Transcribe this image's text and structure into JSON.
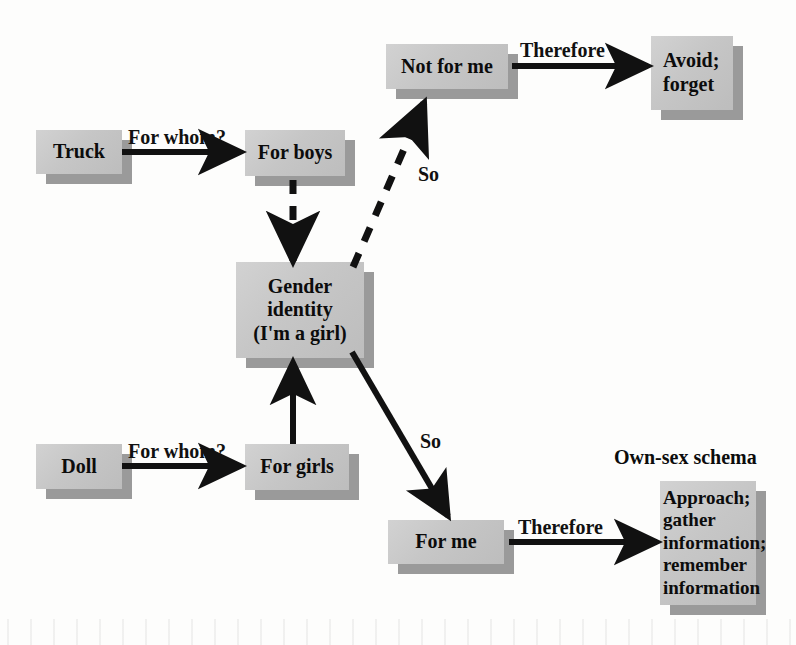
{
  "diagram": {
    "type": "flowchart",
    "colors": {
      "box_fill": "#c6c6c6",
      "box_shadow": "#9a9a9a",
      "text": "#0c0c0c",
      "arrow": "#111111",
      "background": "#fdfdfc"
    },
    "nodes": [
      {
        "id": "truck",
        "label": "Truck"
      },
      {
        "id": "for_boys",
        "label": "For boys"
      },
      {
        "id": "doll",
        "label": "Doll"
      },
      {
        "id": "for_girls",
        "label": "For girls"
      },
      {
        "id": "gender",
        "label": "Gender\nidentity\n(I'm a girl)"
      },
      {
        "id": "not_for_me",
        "label": "Not for me"
      },
      {
        "id": "for_me",
        "label": "For me"
      },
      {
        "id": "avoid",
        "label": "Avoid;\nforget"
      },
      {
        "id": "own_sex",
        "label": "Approach;\ngather\ninformation;\nremember\ninformation"
      }
    ],
    "captions": [
      {
        "id": "own_sex_caption",
        "label": "Own-sex schema"
      }
    ],
    "edges": [
      {
        "id": "truck_to_boys",
        "from": "truck",
        "to": "for_boys",
        "label": "For whom?",
        "style": "solid"
      },
      {
        "id": "doll_to_girls",
        "from": "doll",
        "to": "for_girls",
        "label": "For whom?",
        "style": "solid"
      },
      {
        "id": "boys_to_gender",
        "from": "for_boys",
        "to": "gender",
        "label": "",
        "style": "dashed"
      },
      {
        "id": "girls_to_gender",
        "from": "for_girls",
        "to": "gender",
        "label": "",
        "style": "solid"
      },
      {
        "id": "gender_to_not",
        "from": "gender",
        "to": "not_for_me",
        "label": "So",
        "style": "dashed"
      },
      {
        "id": "gender_to_forme",
        "from": "gender",
        "to": "for_me",
        "label": "So",
        "style": "solid"
      },
      {
        "id": "not_to_avoid",
        "from": "not_for_me",
        "to": "avoid",
        "label": "Therefore",
        "style": "solid"
      },
      {
        "id": "forme_to_own",
        "from": "for_me",
        "to": "own_sex",
        "label": "Therefore",
        "style": "solid"
      }
    ]
  }
}
